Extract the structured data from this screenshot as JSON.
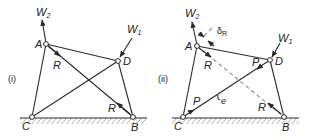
{
  "figure": {
    "panels": [
      {
        "id": "i",
        "label": "(i)",
        "nodes": {
          "A": "A",
          "B": "B",
          "C": "C",
          "D": "D"
        },
        "loads": {
          "W2": {
            "main": "W",
            "sub": "2"
          },
          "W1": {
            "main": "W",
            "sub": "1"
          }
        },
        "forces": {
          "R_top": "R",
          "R_bottom": "R"
        }
      },
      {
        "id": "ii",
        "label": "(ii)",
        "nodes": {
          "A": "A",
          "B": "B",
          "C": "C",
          "D": "D"
        },
        "loads": {
          "W2": {
            "main": "W",
            "sub": "2"
          },
          "W1": {
            "main": "W",
            "sub": "1"
          }
        },
        "forces": {
          "R_top": "R",
          "R_bottom": "R",
          "P_top": "P",
          "P_bottom": "P"
        },
        "annotations": {
          "delta": {
            "main": "δ",
            "sub": "R"
          },
          "e": "e"
        }
      }
    ],
    "colors": {
      "line": "#2a2a2a",
      "dashed": "#8a8a8a",
      "hatch": "#9a9a9a"
    }
  }
}
